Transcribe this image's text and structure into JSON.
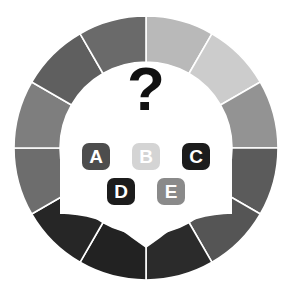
{
  "figure": {
    "name": "multiple-choice-quiz-wheel",
    "background_color": "#ffffff",
    "center_symbol": "?",
    "center_symbol_color": "#111111",
    "inner_circle_color": "#ffffff"
  },
  "answers": {
    "row_top": [
      {
        "key": "A",
        "label": "A",
        "badge_color": "#4d4d4d",
        "text_color": "#ffffff",
        "state": "normal"
      },
      {
        "key": "B",
        "label": "B",
        "badge_color": "#d4d4d4",
        "text_color": "#ffffff",
        "state": "dimmed"
      },
      {
        "key": "C",
        "label": "C",
        "badge_color": "#1c1c1c",
        "text_color": "#ffffff",
        "state": "normal"
      }
    ],
    "row_bottom": [
      {
        "key": "D",
        "label": "D",
        "badge_color": "#1c1c1c",
        "text_color": "#ffffff",
        "state": "normal"
      },
      {
        "key": "E",
        "label": "E",
        "badge_color": "#8a8a8a",
        "text_color": "#ffffff",
        "state": "normal"
      }
    ]
  },
  "chart_data": {
    "type": "pie",
    "title": "",
    "subtitle": "",
    "xlabel": "",
    "ylabel": "",
    "legend_position": "none",
    "grid": false,
    "donut": true,
    "outer_radius": 132,
    "inner_radius": 86,
    "center_x": 146,
    "center_y": 148,
    "start_angle_deg": -90,
    "segment_count": 12,
    "segment_gap_color": "#ffffff",
    "categories": [
      "s1",
      "s2",
      "s3",
      "s4",
      "s5",
      "s6",
      "s7",
      "s8",
      "s9",
      "s10",
      "s11",
      "s12"
    ],
    "values": [
      30,
      30,
      30,
      30,
      30,
      30,
      30,
      30,
      30,
      30,
      30,
      30
    ],
    "colors": [
      "#b9b9b9",
      "#cccccc",
      "#939393",
      "#5b5b5b",
      "#555555",
      "#2b2b2b",
      "#222222",
      "#262626",
      "#6d6d6d",
      "#7e7e7e",
      "#5f5f5f",
      "#6a6a6a"
    ],
    "tick_labels": [],
    "annotations": [
      "?",
      "A",
      "B",
      "C",
      "D",
      "E"
    ]
  },
  "pointer": {
    "name": "selection-pointer",
    "color": "#ffffff",
    "direction": "down"
  }
}
